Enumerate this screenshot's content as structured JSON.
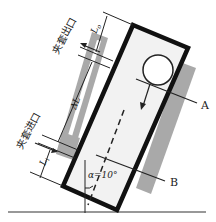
{
  "diagram": {
    "title": "",
    "labels": {
      "jacket_outlet": "夹套出口",
      "jacket_inlet": "夹套进口",
      "lo": "L",
      "lo_sub": "o",
      "delta_l": "ΔL",
      "li": "L",
      "li_sub": "i",
      "section_a": "A",
      "section_b": "B",
      "angle": "α=10°"
    },
    "colors": {
      "outline": "#111111",
      "jacket_grey": "#a9a9a9",
      "inner_fill": "#f2f2f2",
      "line": "#222222"
    }
  }
}
